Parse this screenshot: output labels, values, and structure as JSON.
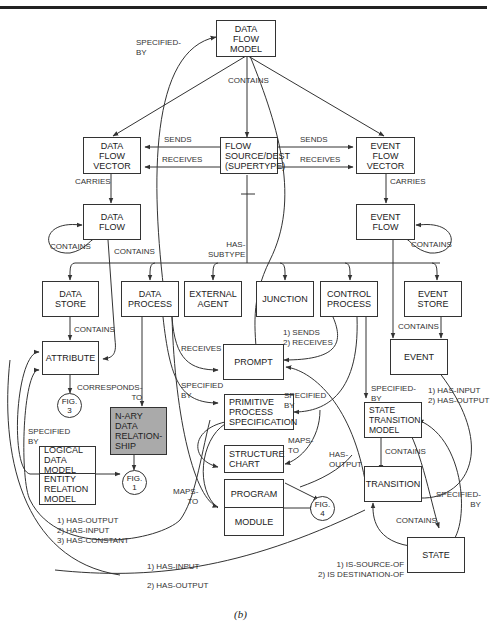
{
  "figure_caption": "(b)",
  "nodes": {
    "data_flow_model": "DATA\nFLOW\nMODEL",
    "data_flow_vector": "DATA\nFLOW\nVECTOR",
    "flow_source_dest": "FLOW\nSOURCE/DEST\n(SUPERTYPE)",
    "event_flow_vector": "EVENT\nFLOW\nVECTOR",
    "data_flow": "DATA\nFLOW",
    "event_flow": "EVENT\nFLOW",
    "data_store": "DATA\nSTORE",
    "data_process": "DATA\nPROCESS",
    "external_agent": "EXTERNAL\nAGENT",
    "junction": "JUNCTION",
    "control_process": "CONTROL\nPROCESS",
    "event_store": "EVENT\nSTORE",
    "attribute": "ATTRIBUTE",
    "prompt": "PROMPT",
    "event": "EVENT",
    "fig3": "FIG.\n3",
    "nary": "N-ARY DATA\nRELATION-\nSHIP",
    "primitive_process": "PRIMITIVE\nPROCESS\nSPECIFICATION",
    "state_transition_model": "STATE\nTRANSITION\nMODEL",
    "logical_data_model": "LOGICAL\nDATA MODEL",
    "entity_relation_model": "ENTITY\nRELATION\nMODEL",
    "fig1": "FIG.\n1",
    "structure_chart": "STRUCTURE\nCHART",
    "program": "PROGRAM",
    "module": "MODULE",
    "fig4": "FIG.\n4",
    "transition": "TRANSITION",
    "state": "STATE"
  },
  "edge_labels": {
    "specified_by_top": "SPECIFIED-\nBY",
    "contains_top": "CONTAINS",
    "sends_left": "SENDS",
    "receives_left": "RECEIVES",
    "sends_right": "SENDS",
    "receives_right": "RECEIVES",
    "carries_left": "CARRIES",
    "carries_right": "CARRIES",
    "contains_df_self": "CONTAINS",
    "contains_ef_self": "CONTAINS",
    "contains_df_attr": "CONTAINS",
    "has_subtype": "HAS-\nSUBTYPE",
    "contains_ds_attr": "CONTAINS",
    "receives_prompt": "RECEIVES",
    "sends_receives": "1) SENDS\n2) RECEIVES",
    "contains_es_event": "CONTAINS",
    "corresponds_to": "CORRESPONDS-\nTO",
    "specified_by_pps": "SPECIFIED\nBY",
    "specified_by_pps2": "SPECIFIED\nBY",
    "specified_by_stm": "SPECIFIED-\nBY",
    "has_input_output_event": "1) HAS-INPUT\n2) HAS-OUTPUT",
    "specified_by_ldm": "SPECIFIED\nBY",
    "maps_to_sc": "MAPS-\nTO",
    "maps_to_pm": "MAPS-\nTO",
    "has_output": "HAS-\nOUTPUT",
    "contains_stm_tr": "CONTAINS",
    "specified_by_state": "SPECIFIED-\nBY",
    "contains_stm_state": "CONTAINS",
    "has_out_in_const": "1) HAS-OUTPUT\n2) HAS-INPUT\n3) HAS-CONSTANT",
    "has_input_bottom": "1) HAS-INPUT",
    "has_output_bottom": "2) HAS-OUTPUT",
    "source_dest": "1) IS-SOURCE-OF\n2) IS DESTINATION-OF"
  }
}
